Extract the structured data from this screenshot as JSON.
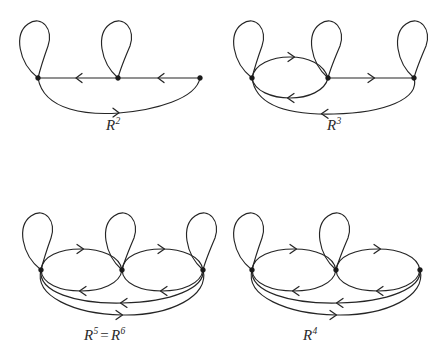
{
  "figure": {
    "type": "diagram",
    "background_color": "#ffffff",
    "stroke_color": "#252525",
    "vertex_color": "#1a1a1a",
    "panel_count": 4
  },
  "panels": [
    {
      "id": "panel-r2",
      "label_text": "R",
      "label_exponent": "2",
      "label_plain": "R^2",
      "position": "top-left",
      "vertices": 3,
      "loops": [
        "left",
        "middle"
      ],
      "edges": [
        {
          "from": "middle",
          "to": "left",
          "shape": "straight",
          "arrow": "left"
        },
        {
          "from": "right",
          "to": "middle",
          "shape": "straight",
          "arrow": "left"
        },
        {
          "from": "left",
          "to": "right",
          "shape": "lower-arc-deep",
          "arrow": "right"
        }
      ]
    },
    {
      "id": "panel-r3",
      "label_text": "R",
      "label_exponent": "3",
      "label_plain": "R^3",
      "position": "top-right",
      "vertices": 3,
      "loops": [
        "left",
        "middle",
        "right"
      ],
      "edges": [
        {
          "from": "left",
          "to": "middle",
          "shape": "upper-arc",
          "arrow": "right"
        },
        {
          "from": "middle",
          "to": "left",
          "shape": "lower-arc",
          "arrow": "left"
        },
        {
          "from": "middle",
          "to": "right",
          "shape": "straight",
          "arrow": "right"
        },
        {
          "from": "right",
          "to": "left",
          "shape": "lower-arc-deep",
          "arrow": "left"
        }
      ]
    },
    {
      "id": "panel-r5-r6",
      "label_text": "R",
      "label_exponent": "5",
      "label_text2": "R",
      "label_exponent2": "6",
      "label_equals": "=",
      "label_plain": "R^5 = R^6",
      "position": "bottom-left",
      "vertices": 3,
      "loops": [
        "left",
        "middle",
        "right"
      ],
      "edges": [
        {
          "from": "left",
          "to": "middle",
          "shape": "upper-arc",
          "arrow": "right"
        },
        {
          "from": "middle",
          "to": "left",
          "shape": "lower-arc",
          "arrow": "left"
        },
        {
          "from": "middle",
          "to": "right",
          "shape": "upper-arc",
          "arrow": "right"
        },
        {
          "from": "right",
          "to": "middle",
          "shape": "lower-arc",
          "arrow": "left"
        },
        {
          "from": "right",
          "to": "left",
          "shape": "lower-arc-mid",
          "arrow": "left"
        },
        {
          "from": "left",
          "to": "right",
          "shape": "lower-arc-deep",
          "arrow": "right"
        }
      ]
    },
    {
      "id": "panel-r4",
      "label_text": "R",
      "label_exponent": "4",
      "label_plain": "R^4",
      "position": "bottom-right",
      "vertices": 3,
      "loops": [
        "left",
        "middle"
      ],
      "edges": [
        {
          "from": "left",
          "to": "middle",
          "shape": "upper-arc",
          "arrow": "right"
        },
        {
          "from": "middle",
          "to": "left",
          "shape": "lower-arc",
          "arrow": "left"
        },
        {
          "from": "middle",
          "to": "right",
          "shape": "upper-arc",
          "arrow": "right"
        },
        {
          "from": "right",
          "to": "middle",
          "shape": "lower-arc",
          "arrow": "left"
        },
        {
          "from": "right",
          "to": "left",
          "shape": "lower-arc-mid",
          "arrow": "left"
        },
        {
          "from": "left",
          "to": "right",
          "shape": "lower-arc-deep",
          "arrow": "right"
        }
      ]
    }
  ],
  "labels": {
    "r2": "R2",
    "r3": "R3",
    "r5r6": "R5 = R6",
    "r4": "R4"
  }
}
